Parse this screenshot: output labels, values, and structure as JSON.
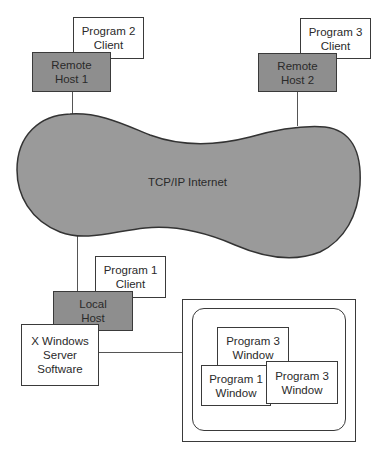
{
  "diagram": {
    "remote_hosts": [
      {
        "label_line1": "Remote",
        "label_line2": "Host 1",
        "client": {
          "line1": "Program 2",
          "line2": "Client"
        }
      },
      {
        "label_line1": "Remote",
        "label_line2": "Host 2",
        "client": {
          "line1": "Program 3",
          "line2": "Client"
        }
      }
    ],
    "network": {
      "label": "TCP/IP Internet"
    },
    "local_host": {
      "label_line1": "Local",
      "label_line2": "Host",
      "client": {
        "line1": "Program 1",
        "line2": "Client"
      },
      "server": {
        "line1": "X Windows",
        "line2": "Server",
        "line3": "Software"
      }
    },
    "display": {
      "windows": [
        {
          "line1": "Program 3",
          "line2": "Window"
        },
        {
          "line1": "Program 1",
          "line2": "Window"
        },
        {
          "line1": "Program 3",
          "line2": "Window"
        }
      ]
    },
    "colors": {
      "host_fill": "#8e8e8e",
      "cloud_fill": "#9a9a9a",
      "stroke": "#3a3a3a"
    }
  }
}
